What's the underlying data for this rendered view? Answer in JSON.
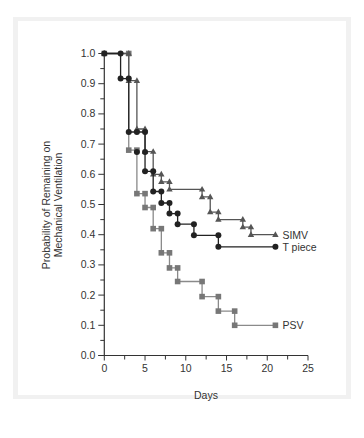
{
  "chart_data": {
    "type": "line",
    "subtype": "kaplan-meier-step",
    "title": "",
    "xlabel": "Days",
    "ylabel": [
      "Probability of Remaining on",
      "Mechanical Ventilation"
    ],
    "xlim": [
      0,
      25
    ],
    "ylim": [
      0.0,
      1.0
    ],
    "x_ticks": [
      0,
      5,
      10,
      15,
      20,
      25
    ],
    "x_tick_labels": [
      "0",
      "5",
      "10",
      "15",
      "20",
      "25"
    ],
    "y_ticks": [
      0.0,
      0.1,
      0.2,
      0.3,
      0.4,
      0.5,
      0.6,
      0.7,
      0.8,
      0.9,
      1.0
    ],
    "y_tick_labels": [
      "0.0",
      "0.1",
      "0.2",
      "0.3",
      "0.4",
      "0.5",
      "0.6",
      "0.7",
      "0.8",
      "0.9",
      "1.0"
    ],
    "grid": false,
    "legend": "inline-right",
    "series": [
      {
        "name": "SIMV",
        "marker": "triangle",
        "color": "#555555",
        "steps": [
          {
            "x": 0,
            "y": 1.0
          },
          {
            "x": 3,
            "y": 0.91
          },
          {
            "x": 4,
            "y": 0.75
          },
          {
            "x": 5,
            "y": 0.675
          },
          {
            "x": 6,
            "y": 0.6
          },
          {
            "x": 7,
            "y": 0.575
          },
          {
            "x": 8,
            "y": 0.55
          },
          {
            "x": 12,
            "y": 0.525
          },
          {
            "x": 13,
            "y": 0.475
          },
          {
            "x": 14,
            "y": 0.45
          },
          {
            "x": 17,
            "y": 0.425
          },
          {
            "x": 18,
            "y": 0.4
          }
        ],
        "end_x": 21
      },
      {
        "name": "T piece",
        "marker": "circle",
        "color": "#222222",
        "steps": [
          {
            "x": 0,
            "y": 1.0
          },
          {
            "x": 2,
            "y": 0.917
          },
          {
            "x": 3,
            "y": 0.74
          },
          {
            "x": 5,
            "y": 0.61
          },
          {
            "x": 6,
            "y": 0.543
          },
          {
            "x": 7,
            "y": 0.505
          },
          {
            "x": 8,
            "y": 0.47
          },
          {
            "x": 9,
            "y": 0.435
          },
          {
            "x": 11,
            "y": 0.398
          },
          {
            "x": 14,
            "y": 0.36
          }
        ],
        "extra_markers": [
          {
            "x": 4,
            "y": 0.74
          },
          {
            "x": 5,
            "y": 0.674
          },
          {
            "x": 4,
            "y": 0.674
          }
        ],
        "end_x": 21
      },
      {
        "name": "PSV",
        "marker": "square",
        "color": "#777777",
        "steps": [
          {
            "x": 0,
            "y": 1.0
          },
          {
            "x": 3,
            "y": 0.68
          },
          {
            "x": 4,
            "y": 0.536
          },
          {
            "x": 5,
            "y": 0.49
          },
          {
            "x": 6,
            "y": 0.42
          },
          {
            "x": 7,
            "y": 0.34
          },
          {
            "x": 8,
            "y": 0.29
          },
          {
            "x": 9,
            "y": 0.245
          },
          {
            "x": 12,
            "y": 0.195
          },
          {
            "x": 14,
            "y": 0.147
          },
          {
            "x": 16,
            "y": 0.1
          }
        ],
        "end_x": 21
      }
    ]
  }
}
